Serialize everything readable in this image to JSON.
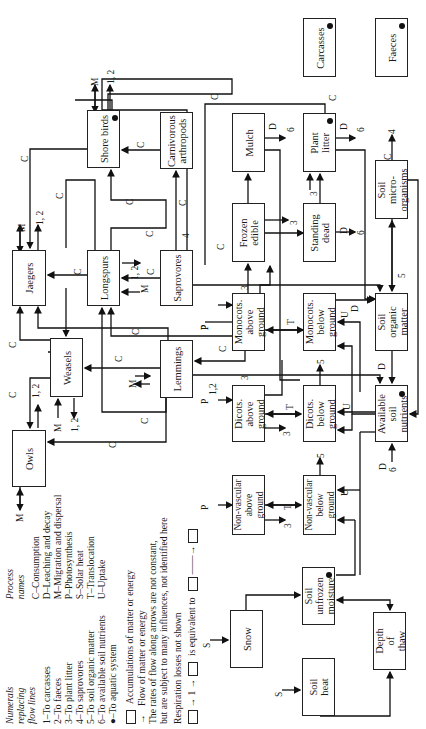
{
  "diagram": {
    "compartments": {
      "carcasses": "Carcasses",
      "faeces": "Faeces",
      "mulch": "Mulch",
      "plant_litter": "Plant\nlitter",
      "shore_birds": "Shore birds",
      "carnivorous_arthropods": "Carnivorous\narthropods",
      "frozen_edible": "Frozen\nedible",
      "standing_dead": "Standing\ndead",
      "soil_microorganisms": "Soil\nmicro-\norganisms",
      "jaegers": "Jaegers",
      "longspurs": "Longspurs",
      "saprovores": "Saprovores",
      "monocots_above": "Monocots.\nabove\nground",
      "monocots_below": "Monocots.\nbelow\nground",
      "soil_organic_matter": "Soil\norganic\nmatter",
      "weasels": "Weasels",
      "lemmings": "Lemmings",
      "dicots_above": "Dicots.\nabove\nground",
      "dicots_below": "Dicots.\nbelow\nground",
      "available_soil_nutrients": "Available\nsoil\nnutrients",
      "owls": "Owls",
      "nonvascular_above": "Non-vascular\nabove\nground",
      "nonvascular_below": "Non-vascular\nbelow\nground",
      "snow": "Snow",
      "soil_unfrozen_moisture": "Soil\nunfrozen\nmoisture",
      "soil_heat": "Soil\nheat",
      "depth_of_thaw": "Depth\nof\nthaw"
    },
    "flow_labels": {
      "C": "C",
      "D": "D",
      "M": "M",
      "P": "P",
      "S": "S",
      "T": "T",
      "U": "U",
      "n1": "1",
      "n2": "2",
      "n3": "3",
      "n4": "4",
      "n5": "5",
      "n6": "6",
      "n12": "1, 2",
      "n12b": "1,2"
    }
  },
  "legend": {
    "numerals_title": "Numerals\nreplacing\nflow lines",
    "numerals": [
      "1–To carcasses",
      "2–To faeces",
      "3–To plant litter",
      "4–To saprovores",
      "5–To soil organic matter",
      "6–To available soil nutrients",
      "●–To aquatic system"
    ],
    "process_title": "Process\nnames",
    "processes": [
      "C–Consumption",
      "D–Leaching and decay",
      "M–Migration and dispersal",
      "P–Photosynthesis",
      "S–Solar heat",
      "T–Translocation",
      "U–Uptake"
    ],
    "accumulations": "Accumulations of matter or energy",
    "flow": "Flow of matter or energy",
    "rates_note_1": "The rates of flow along arrows are not constant,",
    "rates_note_2": "but are subject to many influences, not identified here",
    "respiration": "Respiration losses not shown",
    "equivalence_mid": "1",
    "equivalence_text": "is equivalent to"
  }
}
